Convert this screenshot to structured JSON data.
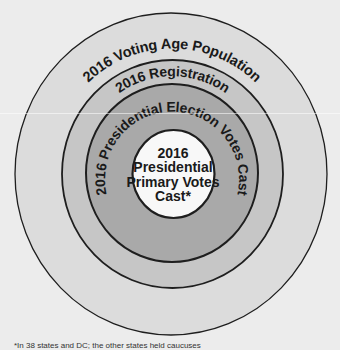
{
  "diagram": {
    "type": "nested-circles",
    "rings": [
      {
        "id": "voting-age-population",
        "label": "2016 Voting Age Population",
        "fill": "#dcdcdc"
      },
      {
        "id": "registration",
        "label": "2016 Registration",
        "fill": "#c6c6c6"
      },
      {
        "id": "presidential-election-votes-cast",
        "label": "2016 Presidential Election Votes Cast",
        "fill": "#a9a9a9"
      },
      {
        "id": "presidential-primary-votes-cast",
        "label_lines": [
          "2016",
          "Presidential",
          "Primary Votes",
          "Cast*"
        ],
        "fill": "#f8f8f8"
      }
    ],
    "colors": {
      "background": "#ececec",
      "stroke": "#1e1e1e"
    },
    "footnote": "*In 38 states and DC; the other states held caucuses"
  }
}
